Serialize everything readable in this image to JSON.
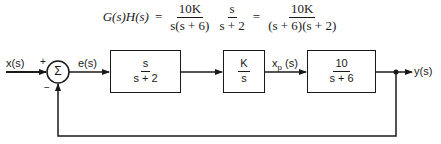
{
  "equation": {
    "lhs": "G(s)H(s)",
    "equals": "=",
    "term1": {
      "num": "10K",
      "den": "s(s + 6)"
    },
    "term2": {
      "num": "s",
      "den": "s + 2"
    },
    "equals2": "=",
    "result": {
      "num": "10K",
      "den": "(s + 6)(s + 2)"
    }
  },
  "signals": {
    "input": "x(s)",
    "error": "e(s)",
    "intermediate": "x",
    "intermediate_sub": "p",
    "intermediate_arg": " (s)",
    "output": "y(s)"
  },
  "summing_junction": {
    "symbol": "Σ",
    "plus": "+",
    "minus": "−"
  },
  "blocks": [
    {
      "num": "s",
      "den": "s + 2"
    },
    {
      "num": "K",
      "den": "s"
    },
    {
      "num": "10",
      "den": "s + 6"
    }
  ],
  "colors": {
    "stroke": "#1a1a1a",
    "background": "#ffffff"
  }
}
